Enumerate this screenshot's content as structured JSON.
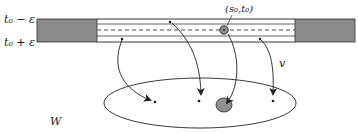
{
  "diagram": {
    "labels": {
      "top_time": "t₀ − ε",
      "bottom_time": "t₀ + ε",
      "point": "(s₀,t₀)",
      "vector": "v",
      "set": "W"
    },
    "colors": {
      "block_fill": "#8a8a8a",
      "disk_fill": "#8f8f8f",
      "stroke": "#222222"
    },
    "elements": {
      "strip": "horizontal band between t0-ε and t0+ε with dashed midline, grey end blocks",
      "ellipse": "region W below the strip",
      "arrows": 4,
      "marked_points_in_strip": 3,
      "marked_points_in_W": 3
    }
  }
}
